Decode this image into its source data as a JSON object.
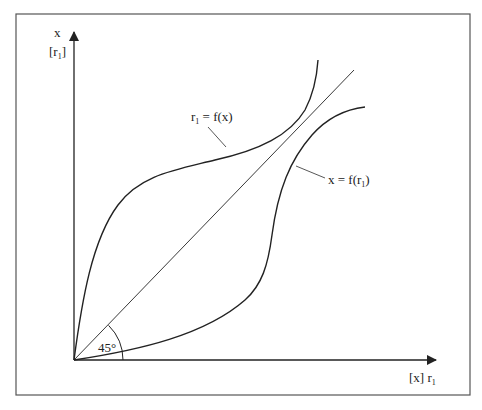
{
  "y_axis": {
    "label_top": "x",
    "label_bottom_base": "[r",
    "label_bottom_sub": "1",
    "label_bottom_close": "]"
  },
  "x_axis": {
    "label_base": "[x] r",
    "label_sub": "1"
  },
  "curves": {
    "upper": {
      "label_pre": "r",
      "label_sub": "1",
      "label_post": " = f(x)"
    },
    "lower": {
      "label_pre": "x = f(r",
      "label_sub": "1",
      "label_post": ")"
    }
  },
  "angle": {
    "label": "45°"
  },
  "colors": {
    "ink": "#222222",
    "frame": "#555555"
  }
}
